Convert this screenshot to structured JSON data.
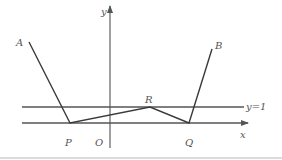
{
  "diagram": {
    "type": "coordinate-geometry",
    "axes": {
      "x_label": "x",
      "y_label": "y",
      "origin_label": "O"
    },
    "horizontal_line": {
      "label": "y=1"
    },
    "points": {
      "A": "A",
      "B": "B",
      "P": "P",
      "Q": "Q",
      "R": "R"
    },
    "segments": [
      "AP",
      "PR",
      "RQ",
      "QB"
    ],
    "colors": {
      "line": "#3a3a3a",
      "axis": "#6e6e6e",
      "label": "#555555",
      "background": "#ffffff"
    }
  }
}
